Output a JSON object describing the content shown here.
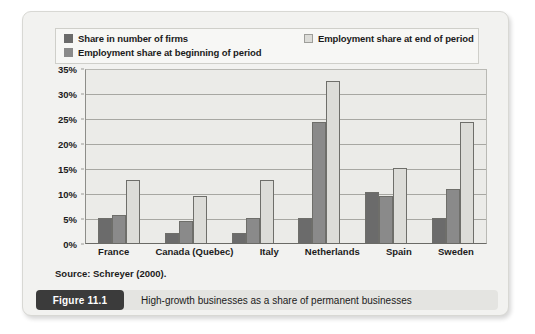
{
  "figure": {
    "number_label": "Figure 11.1",
    "caption": "High-growth businesses as a share of permanent businesses",
    "source": "Source: Schreyer (2000)."
  },
  "legend": {
    "entries": [
      {
        "label": "Share in number of firms",
        "color": "#6b6b6b"
      },
      {
        "label": "Employment share at beginning of period",
        "color": "#8a8a8a"
      },
      {
        "label": "Employment share at end of period",
        "color": "#dcdcd8"
      }
    ]
  },
  "chart_data": {
    "type": "bar",
    "title": "High-growth businesses as a share of permanent businesses",
    "xlabel": "",
    "ylabel": "",
    "ylim": [
      0,
      35
    ],
    "grid": true,
    "legend_position": "top",
    "categories": [
      "France",
      "Canada (Quebec)",
      "Italy",
      "Netherlands",
      "Spain",
      "Sweden"
    ],
    "y_ticks": [
      "0%",
      "5%",
      "10%",
      "15%",
      "20%",
      "25%",
      "30%",
      "35%"
    ],
    "y_tick_values": [
      0,
      5,
      10,
      15,
      20,
      25,
      30,
      35
    ],
    "series": [
      {
        "name": "Share in number of firms",
        "color": "#6b6b6b",
        "values": [
          5.0,
          2.0,
          2.0,
          5.0,
          10.3,
          5.0
        ]
      },
      {
        "name": "Employment share at beginning of period",
        "color": "#8a8a8a",
        "values": [
          5.6,
          4.5,
          5.0,
          24.5,
          9.5,
          11.0
        ]
      },
      {
        "name": "Employment share at end of period",
        "color": "#dcdcd8",
        "values": [
          12.8,
          9.5,
          12.8,
          32.8,
          15.2,
          24.5
        ]
      }
    ]
  }
}
